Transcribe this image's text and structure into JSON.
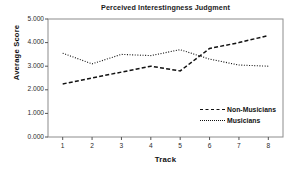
{
  "chart_data": {
    "type": "line",
    "title": "Perceived Interestingness Judgment",
    "xlabel": "Track",
    "ylabel": "Average Score",
    "categories": [
      "1",
      "2",
      "3",
      "4",
      "5",
      "6",
      "7",
      "8"
    ],
    "x": [
      1,
      2,
      3,
      4,
      5,
      6,
      7,
      8
    ],
    "xlim": [
      0.5,
      8.5
    ],
    "ylim": [
      0.0,
      5.0
    ],
    "ytick_labels": [
      "5.000",
      "4.000",
      "3.000",
      "2.000",
      "1.000",
      "0.000"
    ],
    "ytick_values": [
      5.0,
      4.0,
      3.0,
      2.0,
      1.0,
      0.0
    ],
    "grid": false,
    "legend_position": "inside lower right",
    "series": [
      {
        "name": "Non-Musicians",
        "style": "dashed",
        "color": "#111111",
        "values": [
          2.25,
          2.5,
          2.75,
          3.0,
          2.8,
          3.75,
          4.0,
          4.3
        ]
      },
      {
        "name": "Musicians",
        "style": "dotted",
        "color": "#111111",
        "values": [
          3.55,
          3.1,
          3.5,
          3.45,
          3.7,
          3.3,
          3.05,
          3.0
        ]
      }
    ]
  },
  "legend": {
    "items": [
      {
        "label": "Non-Musicians"
      },
      {
        "label": "Musicians"
      }
    ]
  }
}
